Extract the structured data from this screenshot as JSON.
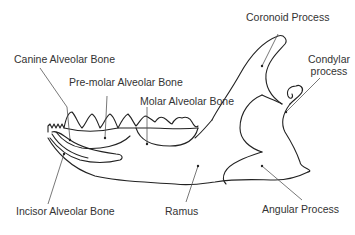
{
  "diagram": {
    "labels": {
      "coronoid_process": "Coronoid Process",
      "condylar_process_line1": "Condylar",
      "condylar_process_line2": "process",
      "canine_alveolar_bone": "Canine  Alveolar Bone",
      "premolar_alveolar_bone": "Pre-molar Alveolar Bone",
      "molar_alveolar_bone": "Molar Alveolar Bone",
      "incisor_alveolar_bone": "Incisor Alveolar Bone",
      "ramus": "Ramus",
      "angular_process": "Angular Process"
    },
    "colors": {
      "line": "#222222",
      "leader": "#555555",
      "text": "#333333",
      "background": "#ffffff"
    }
  }
}
